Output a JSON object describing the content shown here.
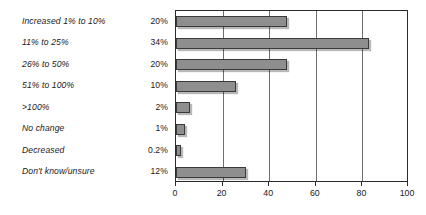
{
  "chart_data": {
    "type": "bar",
    "orientation": "horizontal",
    "title": "",
    "subtitle": "",
    "xlabel": "",
    "ylabel": "",
    "xlim": [
      0,
      100
    ],
    "xticks": [
      0,
      20,
      40,
      60,
      80,
      100
    ],
    "grid": true,
    "legend": false,
    "categories": [
      "Increased 1% to 10%",
      "11% to 25%",
      "26% to 50%",
      "51% to 100%",
      ">100%",
      "No change",
      "Decreased",
      "Don't know/unsure"
    ],
    "value_labels": [
      "20%",
      "34%",
      "20%",
      "10%",
      "2%",
      "1%",
      "0.2%",
      "12%"
    ],
    "values": [
      48,
      83,
      48,
      26,
      6,
      4,
      2,
      30
    ],
    "percentages": [
      20,
      34,
      20,
      10,
      2,
      1,
      0.2,
      12
    ],
    "bar_fill": "#8e8e8e",
    "bar_border": "#3a3a3a",
    "axis_color": "#2b2b2b",
    "grid_color": "#6e6e6e",
    "background": "#ffffff"
  }
}
